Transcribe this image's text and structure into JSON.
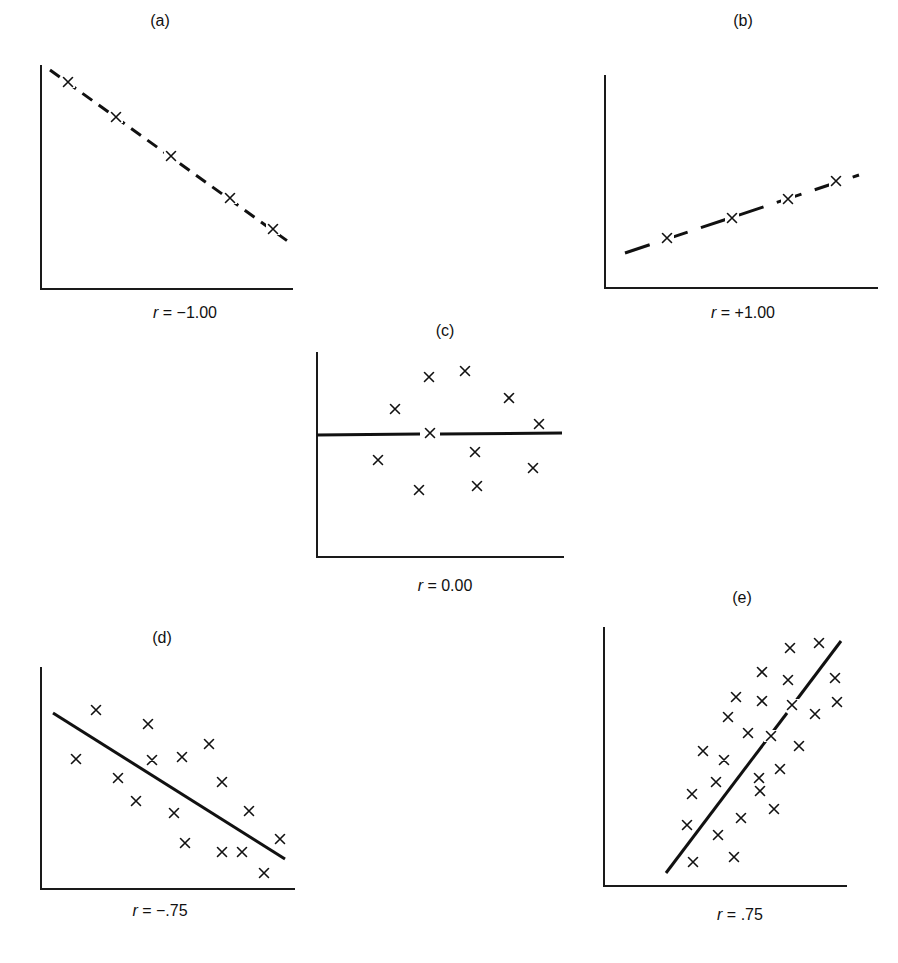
{
  "figure": {
    "panels": [
      {
        "id": "a",
        "title": "(a)",
        "r_symbol": "r",
        "r_text": " = −1.00"
      },
      {
        "id": "b",
        "title": "(b)",
        "r_symbol": "r",
        "r_text": " = +1.00"
      },
      {
        "id": "c",
        "title": "(c)",
        "r_symbol": "r",
        "r_text": " = 0.00"
      },
      {
        "id": "d",
        "title": "(d)",
        "r_symbol": "r",
        "r_text": " = −.75"
      },
      {
        "id": "e",
        "title": "(e)",
        "r_symbol": "r",
        "r_text": " = .75"
      }
    ]
  },
  "chart_data": [
    {
      "type": "scatter",
      "title": "(a)",
      "annotation": "r = -1.00",
      "xlabel": "",
      "ylabel": "",
      "grid": false,
      "axes_px": {
        "x0": 40,
        "y0": 289,
        "x1": 292,
        "ytop": 65
      },
      "points_px": [
        [
          68,
          82
        ],
        [
          116,
          117
        ],
        [
          171,
          156
        ],
        [
          230,
          198
        ],
        [
          273,
          229
        ]
      ],
      "fit_line_px": [
        [
          50,
          70
        ],
        [
          293,
          245
        ]
      ],
      "fit_line_style": "dashed (broken at points)"
    },
    {
      "type": "scatter",
      "title": "(b)",
      "annotation": "r = +1.00",
      "xlabel": "",
      "ylabel": "",
      "grid": false,
      "axes_px": {
        "x0": 605,
        "y0": 289,
        "x1": 877,
        "ytop": 75
      },
      "points_px": [
        [
          667,
          238
        ],
        [
          732,
          218
        ],
        [
          788,
          199
        ],
        [
          836,
          181
        ]
      ],
      "fit_line_px": [
        [
          625,
          253
        ],
        [
          859,
          175
        ]
      ],
      "fit_line_style": "dashed (broken at points)"
    },
    {
      "type": "scatter",
      "title": "(c)",
      "annotation": "r = 0.00",
      "xlabel": "",
      "ylabel": "",
      "grid": false,
      "axes_px": {
        "x0": 317,
        "y0": 557,
        "x1": 563,
        "ytop": 352
      },
      "points_px": [
        [
          429,
          377
        ],
        [
          465,
          371
        ],
        [
          395,
          409
        ],
        [
          509,
          398
        ],
        [
          539,
          424
        ],
        [
          430,
          433
        ],
        [
          378,
          460
        ],
        [
          475,
          452
        ],
        [
          533,
          468
        ],
        [
          419,
          490
        ],
        [
          477,
          486
        ]
      ],
      "fit_line_px": [
        [
          317,
          435
        ],
        [
          562,
          433
        ]
      ],
      "fit_line_style": "solid (broken at center point)"
    },
    {
      "type": "scatter",
      "title": "(d)",
      "annotation": "r = -.75",
      "xlabel": "",
      "ylabel": "",
      "grid": false,
      "axes_px": {
        "x0": 40,
        "y0": 889,
        "x1": 294,
        "ytop": 667
      },
      "points_px": [
        [
          96,
          710
        ],
        [
          148,
          724
        ],
        [
          76,
          759
        ],
        [
          152,
          760
        ],
        [
          182,
          757
        ],
        [
          209,
          744
        ],
        [
          118,
          778
        ],
        [
          222,
          782
        ],
        [
          136,
          801
        ],
        [
          174,
          813
        ],
        [
          249,
          811
        ],
        [
          280,
          839
        ],
        [
          185,
          843
        ],
        [
          222,
          852
        ],
        [
          242,
          852
        ],
        [
          264,
          873
        ]
      ],
      "fit_line_px": [
        [
          53,
          713
        ],
        [
          285,
          859
        ]
      ],
      "fit_line_style": "solid"
    },
    {
      "type": "scatter",
      "title": "(e)",
      "annotation": "r = .75",
      "xlabel": "",
      "ylabel": "",
      "grid": false,
      "axes_px": {
        "x0": 604,
        "y0": 886,
        "x1": 846,
        "ytop": 627
      },
      "points_px": [
        [
          790,
          648
        ],
        [
          819,
          643
        ],
        [
          762,
          672
        ],
        [
          788,
          680
        ],
        [
          835,
          678
        ],
        [
          736,
          697
        ],
        [
          762,
          701
        ],
        [
          792,
          705
        ],
        [
          837,
          702
        ],
        [
          728,
          717
        ],
        [
          815,
          714
        ],
        [
          748,
          733
        ],
        [
          771,
          736
        ],
        [
          799,
          746
        ],
        [
          703,
          751
        ],
        [
          724,
          760
        ],
        [
          780,
          769
        ],
        [
          716,
          782
        ],
        [
          759,
          778
        ],
        [
          692,
          794
        ],
        [
          760,
          791
        ],
        [
          774,
          809
        ],
        [
          741,
          818
        ],
        [
          687,
          825
        ],
        [
          718,
          835
        ],
        [
          693,
          862
        ],
        [
          734,
          857
        ]
      ],
      "fit_line_px": [
        [
          666,
          873
        ],
        [
          841,
          641
        ]
      ],
      "fit_line_style": "solid (broken near upper right)"
    }
  ]
}
